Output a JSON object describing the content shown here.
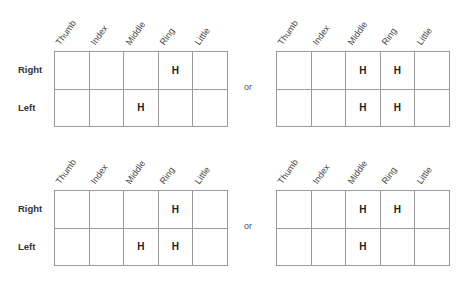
{
  "columns": [
    "Thumb",
    "Index",
    "Middle",
    "Ring",
    "Little"
  ],
  "rows": [
    "Right",
    "Left"
  ],
  "separator": "or",
  "marker": "H",
  "diagrams": [
    {
      "id": "top-left",
      "cells": [
        [
          "",
          "",
          "",
          "H",
          ""
        ],
        [
          "",
          "",
          "H",
          "",
          ""
        ]
      ]
    },
    {
      "id": "top-right",
      "cells": [
        [
          "",
          "",
          "H",
          "H",
          ""
        ],
        [
          "",
          "",
          "H",
          "H",
          ""
        ]
      ]
    },
    {
      "id": "bottom-left",
      "cells": [
        [
          "",
          "",
          "",
          "H",
          ""
        ],
        [
          "",
          "",
          "H",
          "H",
          ""
        ]
      ]
    },
    {
      "id": "bottom-right",
      "cells": [
        [
          "",
          "",
          "H",
          "H",
          ""
        ],
        [
          "",
          "",
          "H",
          "",
          ""
        ]
      ]
    }
  ]
}
